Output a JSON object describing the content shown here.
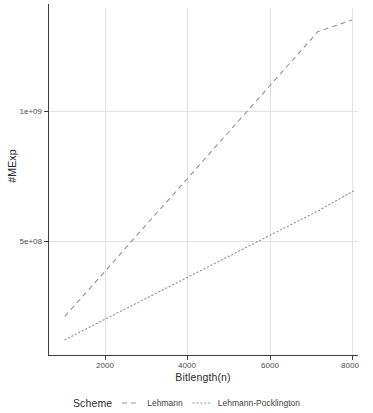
{
  "chart_data": {
    "type": "line",
    "title": "",
    "xlabel": "Bitlength(n)",
    "ylabel": "#MExp",
    "xlim": [
      800,
      8100
    ],
    "ylim": [
      95000000,
      1400000000
    ],
    "grid": true,
    "legend_position": "bottom",
    "legend_title": "Scheme",
    "xticks": [
      2000,
      4000,
      6000,
      8000
    ],
    "xticklabels": [
      "2000",
      "4000",
      "6000",
      "8000"
    ],
    "yticks": [
      500000000,
      1000000000
    ],
    "yticklabels": [
      "5e+08",
      "1e+09"
    ],
    "series": [
      {
        "name": "Lehmann",
        "linestyle": "dashed",
        "color": "#8b93a6",
        "x": [
          1024,
          2048,
          3072,
          4096,
          5120,
          6144,
          7168,
          8000
        ],
        "values": [
          210000000,
          392000000,
          575000000,
          757000000,
          940000000,
          1122000000,
          1305000000,
          1350000000
        ]
      },
      {
        "name": "Lehmann-Pocklington",
        "linestyle": "dotted",
        "color": "#8b93a6",
        "x": [
          1024,
          2048,
          3072,
          4096,
          5120,
          6144,
          7168,
          8075
        ],
        "values": [
          120000000,
          203000000,
          285000000,
          368000000,
          450000000,
          533000000,
          615000000,
          696000000
        ]
      }
    ]
  },
  "axes": {
    "x_title": "Bitlength(n)",
    "y_title": "#MExp",
    "x_tick_labels": [
      "2000",
      "4000",
      "6000",
      "8000"
    ],
    "y_tick_labels": [
      "5e+08",
      "1e+09"
    ]
  },
  "legend": {
    "title": "Scheme",
    "entries": [
      {
        "label": "Lehmann",
        "style": "dashed"
      },
      {
        "label": "Lehmann-Pocklington",
        "style": "dotted"
      }
    ]
  },
  "colors": {
    "line": "#8b93a6",
    "axis": "#3f3f3f",
    "grid": "#ebebeb",
    "text": "#4d4d4d",
    "background": "#ffffff"
  }
}
